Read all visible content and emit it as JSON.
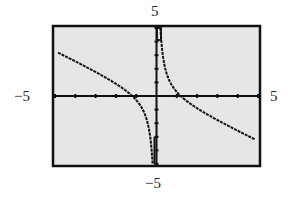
{
  "chart_data": {
    "type": "line",
    "title": "",
    "xlabel": "",
    "ylabel": "",
    "xlim": [
      -5,
      5
    ],
    "ylim": [
      -5,
      5
    ],
    "grid": false,
    "legend": null,
    "window_labels": {
      "ymax": "5",
      "ymin": "−5",
      "xmin": "−5",
      "xmax": "5"
    },
    "x_ticks": [
      -5,
      -4,
      -3,
      -2,
      -1,
      0,
      1,
      2,
      3,
      4,
      5
    ],
    "y_ticks": [
      -5,
      -4,
      -3,
      -2,
      -1,
      0,
      1,
      2,
      3,
      4,
      5
    ],
    "annotations": [
      "vertical asymptote at x = 0"
    ],
    "series": [
      {
        "name": "left branch",
        "x": [
          -4.8,
          -4.0,
          -3.0,
          -2.0,
          -1.5,
          -1.2,
          -1.0,
          -0.8,
          -0.6,
          -0.4,
          -0.3,
          -0.2
        ],
        "y": [
          3.2,
          2.55,
          1.77,
          0.9,
          0.38,
          0.01,
          -0.3,
          -0.69,
          -1.25,
          -2.22,
          -3.12,
          -4.86
        ]
      },
      {
        "name": "right branch",
        "x": [
          0.2,
          0.3,
          0.4,
          0.6,
          0.8,
          1.0,
          1.2,
          1.5,
          2.0,
          3.0,
          4.0,
          4.8
        ],
        "y": [
          4.86,
          3.12,
          2.22,
          1.25,
          0.69,
          0.3,
          -0.01,
          -0.38,
          -0.9,
          -1.77,
          -2.55,
          -3.15
        ]
      }
    ]
  },
  "colors": {
    "frame": "#111111",
    "plot_bg": "#e6e6e6",
    "curve": "#111111"
  }
}
